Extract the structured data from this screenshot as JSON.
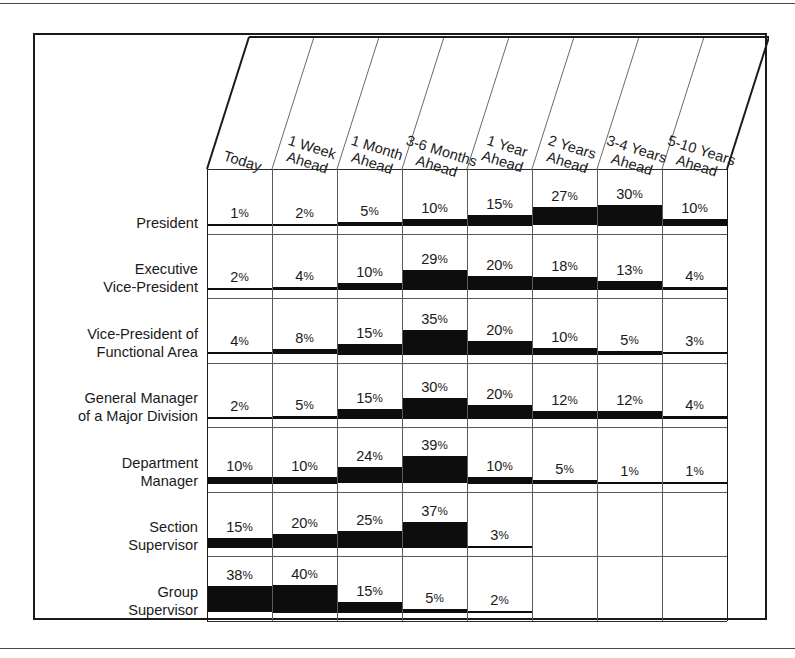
{
  "chart_data": {
    "type": "heatmap",
    "title": "",
    "xlabel": "",
    "ylabel": "",
    "value_suffix": "%",
    "categories": [
      "Today",
      "1 Week Ahead",
      "1 Month Ahead",
      "3-6 Months Ahead",
      "1 Year Ahead",
      "2 Years Ahead",
      "3-4 Years Ahead",
      "5-10 Years Ahead"
    ],
    "category_lines": [
      [
        "Today"
      ],
      [
        "1 Week",
        "Ahead"
      ],
      [
        "1 Month",
        "Ahead"
      ],
      [
        "3-6 Months",
        "Ahead"
      ],
      [
        "1 Year",
        "Ahead"
      ],
      [
        "2 Years",
        "Ahead"
      ],
      [
        "3-4 Years",
        "Ahead"
      ],
      [
        "5-10 Years",
        "Ahead"
      ]
    ],
    "series": [
      {
        "name": "President",
        "name_lines": [
          "President"
        ],
        "values": [
          1,
          2,
          5,
          10,
          15,
          27,
          30,
          10
        ]
      },
      {
        "name": "Executive Vice-President",
        "name_lines": [
          "Executive",
          "Vice-President"
        ],
        "values": [
          2,
          4,
          10,
          29,
          20,
          18,
          13,
          4
        ]
      },
      {
        "name": "Vice-President of Functional Area",
        "name_lines": [
          "Vice-President of",
          "Functional Area"
        ],
        "values": [
          4,
          8,
          15,
          35,
          20,
          10,
          5,
          3
        ]
      },
      {
        "name": "General Manager of a Major Division",
        "name_lines": [
          "General Manager",
          "of a Major Division"
        ],
        "values": [
          2,
          5,
          15,
          30,
          20,
          12,
          12,
          4
        ]
      },
      {
        "name": "Department Manager",
        "name_lines": [
          "Department",
          "Manager"
        ],
        "values": [
          10,
          10,
          24,
          39,
          10,
          5,
          1,
          1
        ]
      },
      {
        "name": "Section Supervisor",
        "name_lines": [
          "Section",
          "Supervisor"
        ],
        "values": [
          15,
          20,
          25,
          37,
          3,
          null,
          null,
          null
        ]
      },
      {
        "name": "Group Supervisor",
        "name_lines": [
          "Group",
          "Supervisor"
        ],
        "values": [
          38,
          40,
          15,
          5,
          2,
          null,
          null,
          null
        ]
      }
    ],
    "grid": true,
    "legend": "none",
    "bar_color": "#0d0d0d"
  }
}
